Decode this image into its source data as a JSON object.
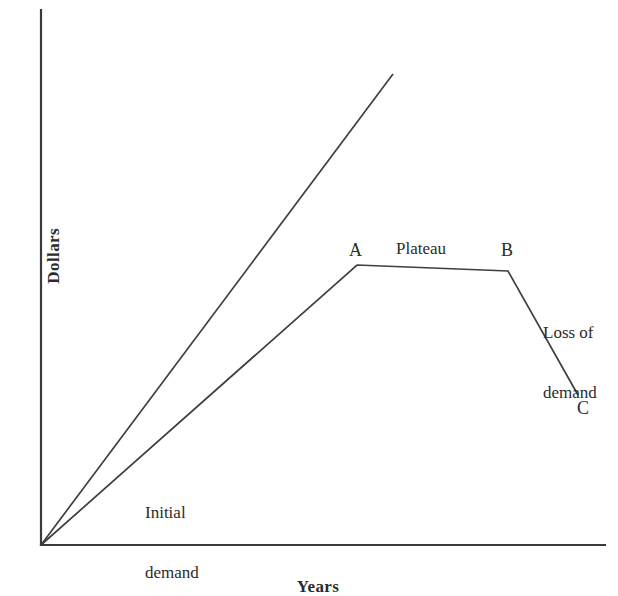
{
  "chart_data": {
    "type": "line",
    "title": "",
    "subtitle": "",
    "xlabel": "Years",
    "ylabel": "Dollars",
    "xlim": [
      0,
      100
    ],
    "ylim": [
      0,
      100
    ],
    "grid": false,
    "axis_ticks": {
      "x": [],
      "y": []
    },
    "legend": {
      "position": "none",
      "entries": []
    },
    "series": [
      {
        "name": "Initial demand",
        "style": "straight-line",
        "points": [
          {
            "x": 0,
            "y": 0
          },
          {
            "x": 62.4,
            "y": 88.2
          }
        ]
      },
      {
        "name": "Actual demand",
        "style": "straight-line",
        "points": [
          {
            "x": 0,
            "y": 0,
            "label": ""
          },
          {
            "x": 56.0,
            "y": 52.3,
            "label": "A"
          },
          {
            "x": 82.8,
            "y": 51.2,
            "label": "B"
          },
          {
            "x": 95.2,
            "y": 28.0,
            "label": "C"
          }
        ]
      }
    ],
    "annotations": [
      {
        "id": "point-a",
        "text": "A",
        "x": 56.0,
        "y": 56.9
      },
      {
        "id": "plateau",
        "text": "Plateau",
        "x": 69.0,
        "y": 57.1
      },
      {
        "id": "point-b",
        "text": "B",
        "x": 82.8,
        "y": 56.9
      },
      {
        "id": "point-c",
        "text": "C",
        "x": 95.2,
        "y": 27.4
      },
      {
        "id": "initial-demand",
        "text": "Initial\ndemand",
        "x": 18.5,
        "y": 15.4
      },
      {
        "id": "loss-of-demand",
        "text": "Loss of\ndemand",
        "x": 89.0,
        "y": 49.0
      }
    ]
  },
  "labels": {
    "y_axis_title": "Dollars",
    "x_axis_title": "Years",
    "point_a": "A",
    "point_b": "B",
    "point_c": "C",
    "plateau": "Plateau",
    "initial_demand_line1": "Initial",
    "initial_demand_line2": "demand",
    "loss_of_demand_line1": "Loss of",
    "loss_of_demand_line2": "demand"
  },
  "geometry": {
    "origin": {
      "x": 41,
      "y": 545
    },
    "y_axis_top": {
      "x": 41,
      "y": 10
    },
    "x_axis_right": {
      "x": 605,
      "y": 545
    },
    "projected_line_end": {
      "x": 393,
      "y": 74
    },
    "vertex_a": {
      "x": 357,
      "y": 265
    },
    "vertex_b": {
      "x": 508,
      "y": 271
    },
    "vertex_c": {
      "x": 578,
      "y": 395
    }
  },
  "colors": {
    "background": "#ffffff",
    "axis": "#3a3a3a",
    "line": "#3f3f3f",
    "text": "#2b2b2b"
  }
}
